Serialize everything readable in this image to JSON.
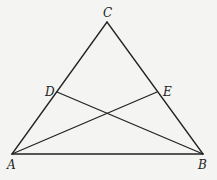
{
  "diagram": {
    "type": "geometry-triangle",
    "points": {
      "A": {
        "label": "A",
        "x": 12,
        "y": 154
      },
      "B": {
        "label": "B",
        "x": 203,
        "y": 154
      },
      "C": {
        "label": "C",
        "x": 107,
        "y": 22
      },
      "D": {
        "label": "D",
        "x": 57,
        "y": 92
      },
      "E": {
        "label": "E",
        "x": 157,
        "y": 92
      }
    },
    "segments": [
      {
        "from": "A",
        "to": "B"
      },
      {
        "from": "B",
        "to": "C"
      },
      {
        "from": "C",
        "to": "A"
      },
      {
        "from": "A",
        "to": "E"
      },
      {
        "from": "B",
        "to": "D"
      }
    ],
    "labels": {
      "A": "A",
      "B": "B",
      "C": "C",
      "D": "D",
      "E": "E"
    }
  }
}
